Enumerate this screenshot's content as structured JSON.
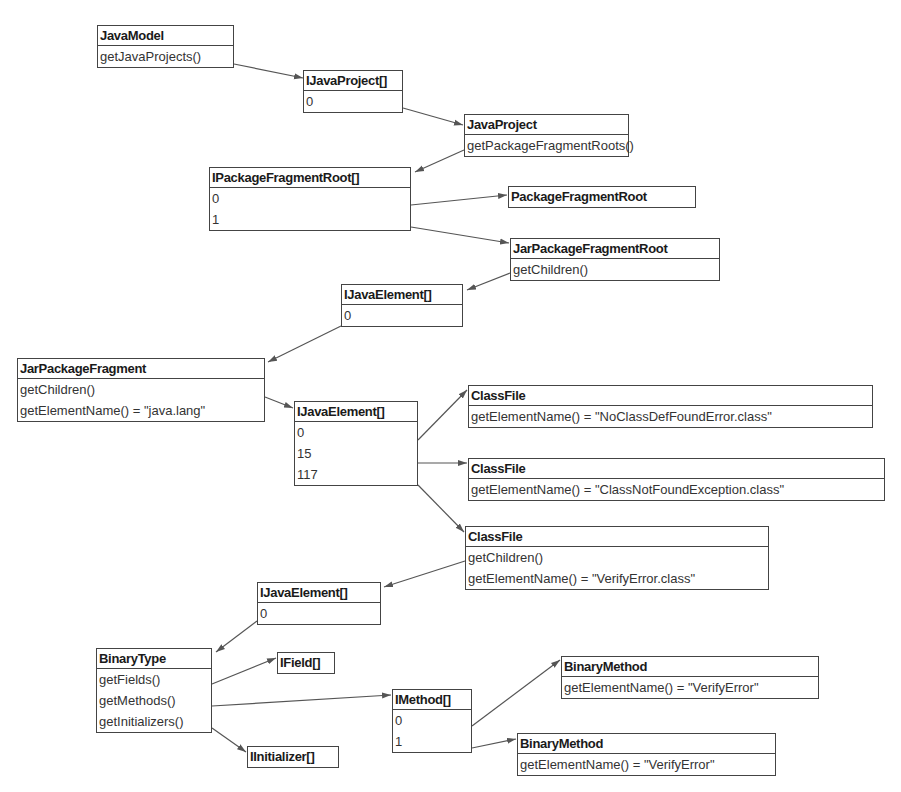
{
  "diagram": {
    "nodes": [
      {
        "id": "javamodel",
        "title": "JavaModel",
        "rows": [
          "getJavaProjects()"
        ],
        "x": 97,
        "y": 25,
        "w": 137
      },
      {
        "id": "ijavaproject_arr",
        "title": "IJavaProject[]",
        "rows": [
          "0"
        ],
        "x": 303,
        "y": 70,
        "w": 100
      },
      {
        "id": "javaproject",
        "title": "JavaProject",
        "rows": [
          "getPackageFragmentRoots()"
        ],
        "x": 464,
        "y": 114,
        "w": 165
      },
      {
        "id": "ipackagefragmentroot_arr",
        "title": "IPackageFragmentRoot[]",
        "rows": [
          "0",
          "1"
        ],
        "x": 209,
        "y": 167,
        "w": 202
      },
      {
        "id": "packagefragmentroot",
        "title": "PackageFragmentRoot",
        "rows": [],
        "x": 508,
        "y": 186,
        "w": 188
      },
      {
        "id": "jarpackagefragmentroot",
        "title": "JarPackageFragmentRoot",
        "rows": [
          "getChildren()"
        ],
        "x": 510,
        "y": 238,
        "w": 210
      },
      {
        "id": "ijavaelement_arr_1",
        "title": "IJavaElement[]",
        "rows": [
          "0"
        ],
        "x": 341,
        "y": 284,
        "w": 122
      },
      {
        "id": "jarpackagefragment",
        "title": "JarPackageFragment",
        "rows": [
          "getChildren()",
          "getElementName() = \"java.lang\""
        ],
        "x": 17,
        "y": 358,
        "w": 248
      },
      {
        "id": "ijavaelement_arr_2",
        "title": "IJavaElement[]",
        "rows": [
          "0",
          "15",
          "117"
        ],
        "x": 294,
        "y": 401,
        "w": 124
      },
      {
        "id": "classfile_1",
        "title": "ClassFile",
        "rows": [
          "getElementName() = \"NoClassDefFoundError.class\""
        ],
        "x": 468,
        "y": 385,
        "w": 405
      },
      {
        "id": "classfile_2",
        "title": "ClassFile",
        "rows": [
          "getElementName() = \"ClassNotFoundException.class\""
        ],
        "x": 468,
        "y": 458,
        "w": 417
      },
      {
        "id": "classfile_3",
        "title": "ClassFile",
        "rows": [
          "getChildren()",
          "getElementName() = \"VerifyError.class\""
        ],
        "x": 465,
        "y": 526,
        "w": 304
      },
      {
        "id": "ijavaelement_arr_3",
        "title": "IJavaElement[]",
        "rows": [
          "0"
        ],
        "x": 257,
        "y": 582,
        "w": 124
      },
      {
        "id": "binarytype",
        "title": "BinaryType",
        "rows": [
          "getFields()",
          "getMethods()",
          "getInitializers()"
        ],
        "x": 96,
        "y": 648,
        "w": 116
      },
      {
        "id": "ifield_arr",
        "title": "IField[]",
        "rows": [],
        "x": 277,
        "y": 652,
        "w": 58
      },
      {
        "id": "imethod_arr",
        "title": "IMethod[]",
        "rows": [
          "0",
          "1"
        ],
        "x": 392,
        "y": 689,
        "w": 80
      },
      {
        "id": "binarymethod_1",
        "title": "BinaryMethod",
        "rows": [
          "getElementName() = \"VerifyError\""
        ],
        "x": 561,
        "y": 656,
        "w": 258
      },
      {
        "id": "binarymethod_2",
        "title": "BinaryMethod",
        "rows": [
          "getElementName() = \"VerifyError\""
        ],
        "x": 517,
        "y": 733,
        "w": 259
      },
      {
        "id": "iinitializer_arr",
        "title": "IInitializer[]",
        "rows": [],
        "x": 247,
        "y": 746,
        "w": 92
      }
    ],
    "edges": [
      {
        "from": "javamodel",
        "to": "ijavaproject_arr",
        "x1": 234,
        "y1": 64,
        "x2": 303,
        "y2": 78
      },
      {
        "from": "ijavaproject_arr",
        "to": "javaproject",
        "x1": 403,
        "y1": 108,
        "x2": 463,
        "y2": 125
      },
      {
        "from": "javaproject",
        "to": "ipackagefragmentroot_arr",
        "x1": 464,
        "y1": 150,
        "x2": 415,
        "y2": 172
      },
      {
        "from": "ipackagefragmentroot_arr",
        "to": "packagefragmentroot",
        "x1": 411,
        "y1": 205,
        "x2": 507,
        "y2": 195
      },
      {
        "from": "ipackagefragmentroot_arr",
        "to": "jarpackagefragmentroot",
        "x1": 411,
        "y1": 227,
        "x2": 509,
        "y2": 243
      },
      {
        "from": "jarpackagefragmentroot",
        "to": "ijavaelement_arr_1",
        "x1": 510,
        "y1": 273,
        "x2": 467,
        "y2": 290
      },
      {
        "from": "ijavaelement_arr_1",
        "to": "jarpackagefragment",
        "x1": 341,
        "y1": 326,
        "x2": 268,
        "y2": 362
      },
      {
        "from": "jarpackagefragment",
        "to": "ijavaelement_arr_2",
        "x1": 265,
        "y1": 397,
        "x2": 293,
        "y2": 408
      },
      {
        "from": "ijavaelement_arr_2",
        "to": "classfile_1",
        "x1": 418,
        "y1": 440,
        "x2": 467,
        "y2": 390
      },
      {
        "from": "ijavaelement_arr_2",
        "to": "classfile_2",
        "x1": 418,
        "y1": 463,
        "x2": 467,
        "y2": 463
      },
      {
        "from": "ijavaelement_arr_2",
        "to": "classfile_3",
        "x1": 418,
        "y1": 485,
        "x2": 464,
        "y2": 532
      },
      {
        "from": "classfile_3",
        "to": "ijavaelement_arr_3",
        "x1": 465,
        "y1": 561,
        "x2": 384,
        "y2": 587
      },
      {
        "from": "ijavaelement_arr_3",
        "to": "binarytype",
        "x1": 257,
        "y1": 621,
        "x2": 216,
        "y2": 652
      },
      {
        "from": "binarytype",
        "to": "ifield_arr",
        "x1": 212,
        "y1": 684,
        "x2": 276,
        "y2": 658
      },
      {
        "from": "binarytype",
        "to": "imethod_arr",
        "x1": 212,
        "y1": 706,
        "x2": 391,
        "y2": 695
      },
      {
        "from": "binarytype",
        "to": "iinitializer_arr",
        "x1": 212,
        "y1": 728,
        "x2": 246,
        "y2": 752
      },
      {
        "from": "imethod_arr",
        "to": "binarymethod_1",
        "x1": 472,
        "y1": 726,
        "x2": 560,
        "y2": 660
      },
      {
        "from": "imethod_arr",
        "to": "binarymethod_2",
        "x1": 472,
        "y1": 748,
        "x2": 516,
        "y2": 739
      }
    ]
  },
  "colors": {
    "border": "#444444",
    "edge": "#555555",
    "background": "#ffffff",
    "text": "#222222"
  }
}
